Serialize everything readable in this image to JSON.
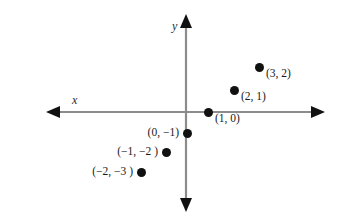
{
  "figure": {
    "background_color": "#ffffff",
    "axis_color": "#8c8c8c",
    "arrow_color": "#111111",
    "point_color": "#111111",
    "text_color": "#1a1a1a"
  },
  "axes": {
    "x_label": "x",
    "y_label": "y",
    "origin_px": {
      "x": 186,
      "y": 112
    },
    "unit_px": 24,
    "x_axis_span_px": {
      "start": 46,
      "end": 325
    },
    "y_axis_span_px": {
      "start": 14,
      "end": 212
    }
  },
  "chart_data": {
    "type": "scatter",
    "title": "",
    "xlabel": "x",
    "ylabel": "y",
    "grid": false,
    "legend": "none",
    "xlim": [
      -6,
      6
    ],
    "ylim": [
      -4,
      4
    ],
    "tick_labels": {
      "x": [],
      "y": []
    },
    "categories": [],
    "series": [
      {
        "name": "plotted points",
        "marker": "filled-circle",
        "color": "#111111",
        "points": [
          {
            "label": "(3, 2)",
            "x": 3,
            "y": 2,
            "px": {
              "x": 259,
              "y": 67
            },
            "label_side": "right"
          },
          {
            "label": "(2, 1)",
            "x": 2,
            "y": 1,
            "px": {
              "x": 234,
              "y": 90
            },
            "label_side": "right"
          },
          {
            "label": "(1, 0)",
            "x": 1,
            "y": 0,
            "px": {
              "x": 208,
              "y": 112
            },
            "label_side": "right"
          },
          {
            "label": "(0, −1)",
            "x": 0,
            "y": -1,
            "px": {
              "x": 187,
              "y": 133
            },
            "label_side": "left"
          },
          {
            "label": "(−1, −2 )",
            "x": -1,
            "y": -2,
            "px": {
              "x": 166,
              "y": 152
            },
            "label_side": "left"
          },
          {
            "label": "(−2, −3 )",
            "x": -2,
            "y": -3,
            "px": {
              "x": 141,
              "y": 172
            },
            "label_side": "left"
          }
        ]
      }
    ]
  }
}
